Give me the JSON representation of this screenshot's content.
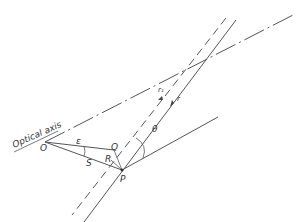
{
  "diagram": {
    "labels": {
      "optical_axis": "Optical axis",
      "O": "O",
      "epsilon": "ε",
      "Q": "Q",
      "S": "S",
      "R": "R",
      "P": "P",
      "theta": "θ",
      "r": "r",
      "r1": "r₁"
    },
    "colors": {
      "line": "#444444",
      "background": "#ffffff"
    }
  }
}
